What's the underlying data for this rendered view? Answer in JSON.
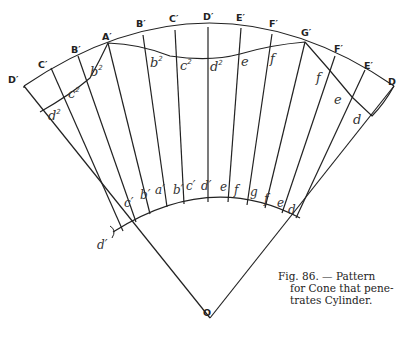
{
  "figure": {
    "number": "86",
    "caption_lines": [
      "Fig. 86. — Pattern",
      "for Cone that pene-",
      "trates Cylinder."
    ],
    "apex_label": "O",
    "outer_labels": {
      "left": [
        "D′",
        "C′",
        "B′",
        "A′"
      ],
      "top": [
        "B′",
        "C′",
        "D′",
        "E′",
        "F′",
        "G′"
      ],
      "right": [
        "F′",
        "E′",
        "D"
      ]
    },
    "inner_curve_labels": {
      "b2_left": "b",
      "c2_left": "c",
      "d2_left": "d",
      "b2_mid": "b",
      "c2_mid": "c",
      "d2_mid": "d",
      "e_mid": "e",
      "f_mid": "f",
      "f_right": "f",
      "e_right": "e",
      "d_right": "d",
      "superscript": "2"
    },
    "base_arc_labels": [
      "d′",
      "c′",
      "b′",
      "a′",
      "b′",
      "c′",
      "d′",
      "e",
      "f",
      "g",
      "f",
      "e",
      "d"
    ]
  }
}
